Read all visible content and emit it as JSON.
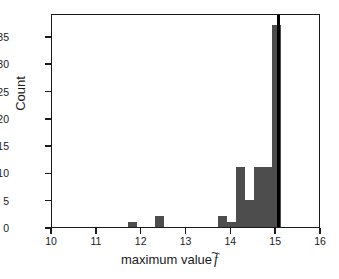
{
  "chart_data": {
    "type": "bar",
    "title": "",
    "subtitle": "",
    "xlabel_prefix": "maximum value",
    "xlabel_symbol": "f",
    "xlabel_accent": "~",
    "xlabel": "maximum value f̃",
    "ylabel": "Count",
    "xlim": [
      10,
      16
    ],
    "ylim": [
      0,
      39.2
    ],
    "grid": false,
    "legend": null,
    "bar_color": "#4d4d4d",
    "axis_color": "#1a1a1a",
    "background": "#ffffff",
    "bin_width": 0.2,
    "xticks": [
      10,
      11,
      12,
      13,
      14,
      15,
      16
    ],
    "xtick_labels": [
      "10",
      "11",
      "12",
      "13",
      "14",
      "15",
      "16"
    ],
    "yticks": [
      0,
      5,
      10,
      15,
      20,
      25,
      30,
      35
    ],
    "ytick_labels": [
      "0",
      "5",
      "10",
      "15",
      "20",
      "25",
      "30",
      "35"
    ],
    "bins": [
      {
        "left": 11.7,
        "right": 11.9,
        "count": 1
      },
      {
        "left": 12.3,
        "right": 12.5,
        "count": 2
      },
      {
        "left": 13.7,
        "right": 13.9,
        "count": 2
      },
      {
        "left": 13.9,
        "right": 14.1,
        "count": 1
      },
      {
        "left": 14.1,
        "right": 14.3,
        "count": 11
      },
      {
        "left": 14.3,
        "right": 14.5,
        "count": 5
      },
      {
        "left": 14.5,
        "right": 14.7,
        "count": 11
      },
      {
        "left": 14.7,
        "right": 14.9,
        "count": 11
      },
      {
        "left": 14.9,
        "right": 15.1,
        "count": 37
      }
    ],
    "annotations": [
      {
        "type": "vline",
        "x": 15.05,
        "color": "#000000",
        "linewidth": 2.5,
        "label": ""
      }
    ]
  }
}
